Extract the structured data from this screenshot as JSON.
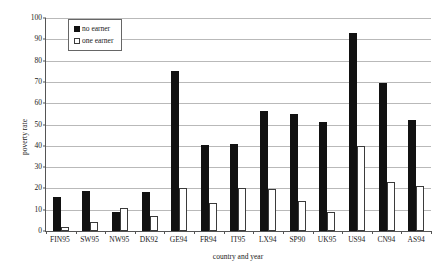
{
  "chart_data": {
    "type": "bar",
    "title": "",
    "xlabel": "country and year",
    "ylabel": "poverty rate",
    "ylim": [
      0,
      100
    ],
    "ytick_step": 10,
    "yticks": [
      0,
      10,
      20,
      30,
      40,
      50,
      60,
      70,
      80,
      90,
      100
    ],
    "grid": true,
    "legend_position": "top-left-inside",
    "categories": [
      "FIN95",
      "SW95",
      "NW95",
      "DK92",
      "GE94",
      "FR94",
      "IT95",
      "LX94",
      "SP90",
      "UK95",
      "US94",
      "CN94",
      "AS94"
    ],
    "series": [
      {
        "name": "no earner",
        "color": "#111111",
        "values": [
          16,
          19,
          9,
          18.5,
          75,
          40.5,
          41,
          56.5,
          55,
          51,
          93,
          69.5,
          52
        ]
      },
      {
        "name": "one earner",
        "color": "#ffffff",
        "values": [
          2,
          4,
          11,
          7,
          20,
          13,
          20,
          19.5,
          14,
          9,
          40,
          23,
          21
        ]
      }
    ]
  },
  "legend": {
    "items": [
      {
        "label": "no earner"
      },
      {
        "label": "one earner"
      }
    ]
  }
}
